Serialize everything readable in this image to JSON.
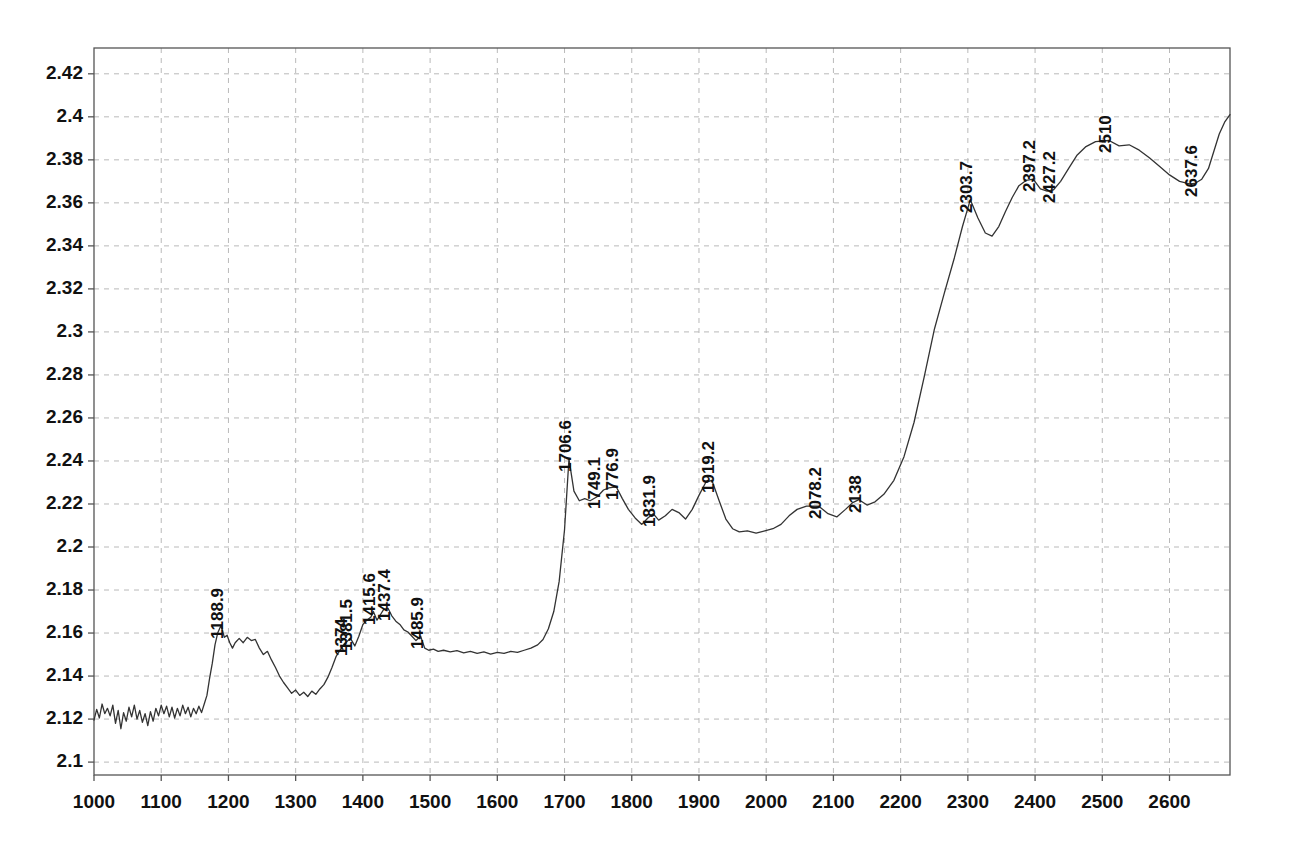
{
  "chart_data": {
    "type": "line",
    "title": "",
    "subtitle": "",
    "xlabel": "",
    "ylabel": "",
    "xlim": [
      1000,
      2690
    ],
    "ylim": [
      2.094,
      2.432
    ],
    "grid": true,
    "legend": null,
    "legend_position": "none",
    "line_color": "#333333",
    "grid_color": "#b9b9b9",
    "axis_color": "#555555",
    "text_color": "#111111",
    "xticks": [
      1000,
      1100,
      1200,
      1300,
      1400,
      1500,
      1600,
      1700,
      1800,
      1900,
      2000,
      2100,
      2200,
      2300,
      2400,
      2500,
      2600
    ],
    "xtick_labels": [
      "1000",
      "1100",
      "1200",
      "1300",
      "1400",
      "1500",
      "1600",
      "1700",
      "1800",
      "1900",
      "2000",
      "2100",
      "2200",
      "2300",
      "2400",
      "2500",
      "2600"
    ],
    "yticks": [
      2.1,
      2.12,
      2.14,
      2.16,
      2.18,
      2.2,
      2.22,
      2.24,
      2.26,
      2.28,
      2.3,
      2.32,
      2.34,
      2.36,
      2.38,
      2.4,
      2.42
    ],
    "ytick_labels": [
      "2.1",
      "2.12",
      "2.14",
      "2.16",
      "2.18",
      "2.2",
      "2.22",
      "2.24",
      "2.26",
      "2.28",
      "2.3",
      "2.32",
      "2.34",
      "2.36",
      "2.38",
      "2.4",
      "2.42"
    ],
    "annotations": [
      {
        "label": "1188.9",
        "x": 1188.9,
        "y": 2.1635
      },
      {
        "label": "1374",
        "x": 1374.0,
        "y": 2.1555
      },
      {
        "label": "1381.5",
        "x": 1381.5,
        "y": 2.1575
      },
      {
        "label": "1415.6",
        "x": 1415.6,
        "y": 2.17
      },
      {
        "label": "1437.4",
        "x": 1437.4,
        "y": 2.1715
      },
      {
        "label": "1485.9",
        "x": 1485.9,
        "y": 2.1585
      },
      {
        "label": "1706.6",
        "x": 1706.6,
        "y": 2.241
      },
      {
        "label": "1749.1",
        "x": 1749.1,
        "y": 2.2235
      },
      {
        "label": "1776.9",
        "x": 1776.9,
        "y": 2.228
      },
      {
        "label": "1831.9",
        "x": 1831.9,
        "y": 2.2155
      },
      {
        "label": "1919.2",
        "x": 1919.2,
        "y": 2.231
      },
      {
        "label": "2078.2",
        "x": 2078.2,
        "y": 2.219
      },
      {
        "label": "2138",
        "x": 2138.0,
        "y": 2.222
      },
      {
        "label": "2303.7",
        "x": 2303.7,
        "y": 2.3615
      },
      {
        "label": "2397.2",
        "x": 2397.2,
        "y": 2.371
      },
      {
        "label": "2427.2",
        "x": 2427.2,
        "y": 2.366
      },
      {
        "label": "2510",
        "x": 2510.0,
        "y": 2.389
      },
      {
        "label": "2637.6",
        "x": 2637.6,
        "y": 2.369
      }
    ],
    "series": [
      {
        "name": "spectrum",
        "x": [
          1000,
          1004,
          1008,
          1012,
          1016,
          1020,
          1024,
          1028,
          1032,
          1036,
          1040,
          1044,
          1048,
          1052,
          1056,
          1060,
          1064,
          1068,
          1072,
          1076,
          1080,
          1084,
          1088,
          1092,
          1096,
          1100,
          1104,
          1108,
          1112,
          1116,
          1120,
          1124,
          1128,
          1132,
          1136,
          1140,
          1144,
          1148,
          1152,
          1156,
          1160,
          1164,
          1168,
          1172,
          1176,
          1180,
          1184,
          1188.9,
          1194,
          1198,
          1202,
          1206,
          1210,
          1216,
          1222,
          1228,
          1234,
          1240,
          1246,
          1252,
          1258,
          1264,
          1270,
          1276,
          1282,
          1288,
          1294,
          1300,
          1306,
          1312,
          1318,
          1324,
          1330,
          1336,
          1342,
          1348,
          1354,
          1360,
          1366,
          1374,
          1381.5,
          1388,
          1394,
          1400,
          1406,
          1412,
          1415.6,
          1421,
          1426,
          1431,
          1437.4,
          1443,
          1449,
          1455,
          1461,
          1467,
          1473,
          1479,
          1485.9,
          1492,
          1498,
          1505,
          1512,
          1520,
          1530,
          1540,
          1550,
          1560,
          1570,
          1580,
          1590,
          1600,
          1610,
          1620,
          1630,
          1640,
          1650,
          1660,
          1668,
          1676,
          1684,
          1692,
          1700,
          1706.6,
          1714,
          1722,
          1730,
          1738,
          1749.1,
          1758,
          1766,
          1776.9,
          1786,
          1795,
          1805,
          1815,
          1824,
          1831.9,
          1840,
          1850,
          1860,
          1870,
          1880,
          1890,
          1900,
          1910,
          1919.2,
          1930,
          1940,
          1950,
          1960,
          1972,
          1985,
          1998,
          2010,
          2022,
          2034,
          2046,
          2060,
          2078.2,
          2092,
          2105,
          2118,
          2128,
          2138,
          2150,
          2162,
          2175,
          2190,
          2205,
          2220,
          2235,
          2250,
          2265,
          2280,
          2292,
          2303.7,
          2315,
          2326,
          2336,
          2346,
          2356,
          2366,
          2376,
          2387,
          2397.2,
          2408,
          2418,
          2427.2,
          2438,
          2450,
          2462,
          2475,
          2490,
          2510,
          2525,
          2540,
          2555,
          2570,
          2585,
          2600,
          2615,
          2630,
          2637.6,
          2648,
          2658,
          2666,
          2674,
          2682,
          2690
        ],
        "y": [
          2.1195,
          2.1245,
          2.1205,
          2.127,
          2.1225,
          2.125,
          2.1215,
          2.1265,
          2.118,
          2.124,
          2.1155,
          2.123,
          2.119,
          2.1255,
          2.121,
          2.1265,
          2.12,
          2.124,
          2.1185,
          2.1225,
          2.117,
          2.1235,
          2.119,
          2.125,
          2.1215,
          2.1265,
          2.1225,
          2.126,
          2.121,
          2.1255,
          2.1205,
          2.125,
          2.1215,
          2.1265,
          2.1225,
          2.1255,
          2.121,
          2.125,
          2.1225,
          2.126,
          2.123,
          2.127,
          2.131,
          2.139,
          2.146,
          2.1545,
          2.16,
          2.1635,
          2.158,
          2.159,
          2.1555,
          2.153,
          2.1555,
          2.1575,
          2.1555,
          2.158,
          2.1565,
          2.157,
          2.153,
          2.15,
          2.1515,
          2.1475,
          2.144,
          2.14,
          2.137,
          2.1345,
          2.132,
          2.1335,
          2.131,
          2.1325,
          2.1305,
          2.133,
          2.1315,
          2.134,
          2.136,
          2.1395,
          2.144,
          2.149,
          2.152,
          2.1555,
          2.1575,
          2.154,
          2.1585,
          2.164,
          2.166,
          2.1675,
          2.17,
          2.166,
          2.1685,
          2.171,
          2.1715,
          2.168,
          2.1655,
          2.164,
          2.1615,
          2.1605,
          2.1585,
          2.1565,
          2.1585,
          2.153,
          2.152,
          2.1525,
          2.1515,
          2.152,
          2.1512,
          2.1518,
          2.1508,
          2.1515,
          2.1505,
          2.1512,
          2.1502,
          2.151,
          2.1505,
          2.1515,
          2.151,
          2.152,
          2.153,
          2.1545,
          2.157,
          2.162,
          2.17,
          2.184,
          2.208,
          2.241,
          2.226,
          2.2215,
          2.2225,
          2.2215,
          2.2235,
          2.2265,
          2.2275,
          2.228,
          2.2225,
          2.2175,
          2.2135,
          2.2105,
          2.2135,
          2.2155,
          2.2125,
          2.2145,
          2.2175,
          2.216,
          2.213,
          2.2175,
          2.224,
          2.23,
          2.231,
          2.2215,
          2.213,
          2.2085,
          2.207,
          2.2075,
          2.2065,
          2.2075,
          2.2085,
          2.2105,
          2.2145,
          2.2175,
          2.219,
          2.219,
          2.2155,
          2.214,
          2.2175,
          2.2205,
          2.222,
          2.2195,
          2.221,
          2.2245,
          2.231,
          2.242,
          2.258,
          2.279,
          2.301,
          2.318,
          2.3345,
          2.349,
          2.3615,
          2.353,
          2.346,
          2.3445,
          2.349,
          2.356,
          2.3625,
          2.368,
          2.3705,
          2.371,
          2.3665,
          2.3655,
          2.366,
          2.37,
          2.376,
          2.382,
          2.386,
          2.3885,
          2.389,
          2.3865,
          2.387,
          2.3845,
          2.381,
          2.377,
          2.373,
          2.37,
          2.3688,
          2.369,
          2.371,
          2.376,
          2.384,
          2.392,
          2.3975,
          2.401
        ]
      }
    ]
  },
  "axis": {
    "y_tick_font_size": "19px",
    "x_tick_font_size": "19px",
    "peak_label_font_size": "17px"
  }
}
